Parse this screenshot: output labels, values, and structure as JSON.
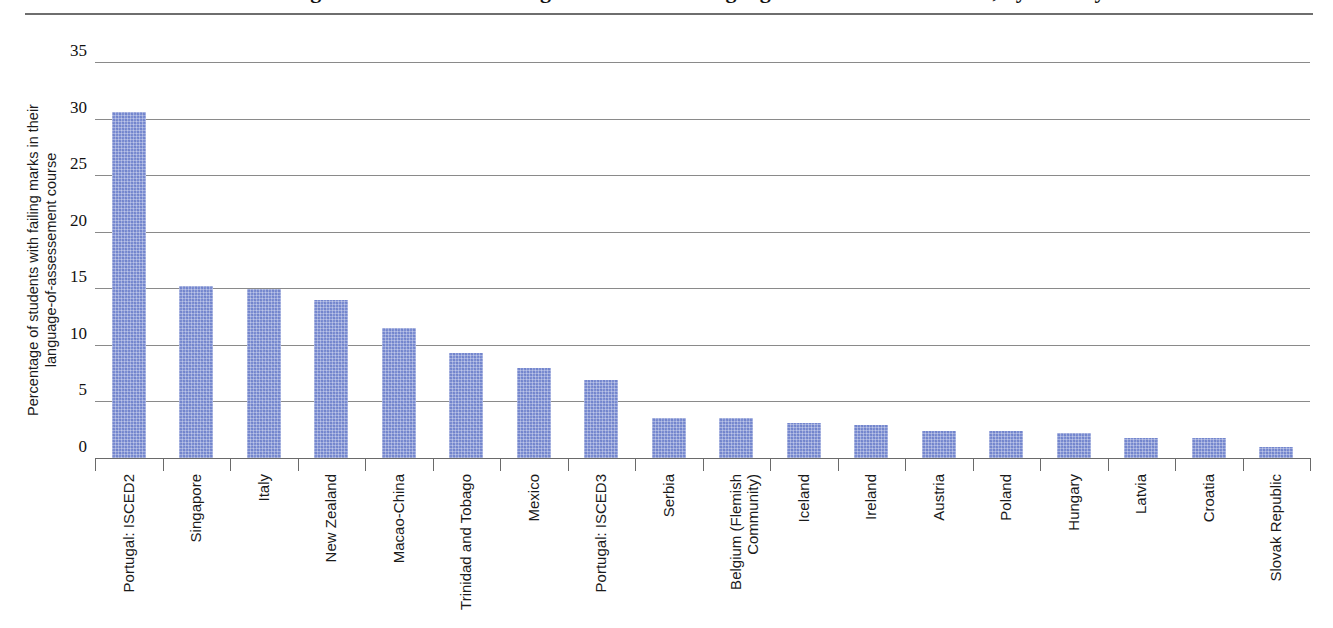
{
  "figure": {
    "title": "Percentage of students with failing marks in their language-of-assessement course, by country",
    "title_visible_note": "title cropped at top edge"
  },
  "chart_data": {
    "type": "bar",
    "title": "",
    "xlabel": "",
    "ylabel": "Percentage of students with failing marks in their\nlanguage-of-assessement course",
    "ylim": [
      0,
      35
    ],
    "yticks": [
      0,
      5,
      10,
      15,
      20,
      25,
      30,
      35
    ],
    "ytick_labels": [
      "0",
      "5",
      "10",
      "15",
      "20",
      "25",
      "30",
      "35"
    ],
    "grid": true,
    "legend": null,
    "bar_color": "#7b8dd2",
    "categories": [
      "Portugal: ISCED2",
      "Singapore",
      "Italy",
      "New Zealand",
      "Macao-China",
      "Trinidad and Tobago",
      "Mexico",
      "Portugal: ISCED3",
      "Serbia",
      "Belgium (Flemish\nCommunity)",
      "Iceland",
      "Ireland",
      "Austria",
      "Poland",
      "Hungary",
      "Latvia",
      "Croatia",
      "Slovak Republic"
    ],
    "values": [
      30.6,
      15.2,
      14.9,
      14.0,
      11.5,
      9.3,
      8.0,
      6.9,
      3.5,
      3.5,
      3.1,
      2.9,
      2.4,
      2.4,
      2.2,
      1.8,
      1.8,
      1.0
    ]
  }
}
